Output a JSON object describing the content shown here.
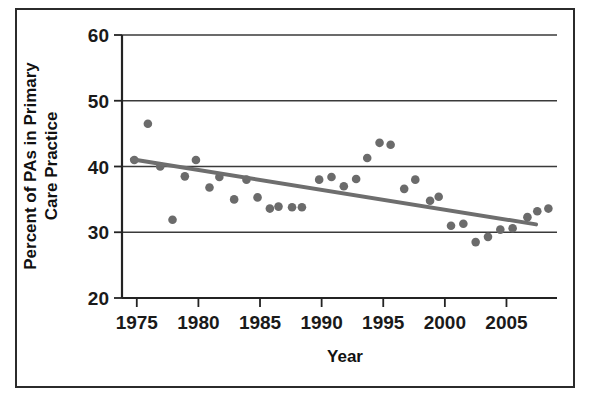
{
  "chart_data": {
    "type": "scatter",
    "title": "",
    "xlabel": "Year",
    "ylabel": "Percent of PAs in Primary Care Practice",
    "xlim": [
      1973.8,
      2009.1
    ],
    "ylim": [
      20,
      60
    ],
    "xticks": [
      1975,
      1980,
      1985,
      1990,
      1995,
      2000,
      2005
    ],
    "xtick_labels": [
      "1975",
      "1980",
      "1985",
      "1990",
      "1995",
      "2000",
      "2005"
    ],
    "yticks": [
      20,
      30,
      40,
      50,
      60
    ],
    "ytick_labels": [
      "20",
      "30",
      "40",
      "50",
      "60"
    ],
    "grid": "horizontal",
    "legend": "none",
    "series": [
      {
        "name": "Percent of PAs in Primary Care Practice",
        "marker": "circle",
        "color": "#6b6b6b",
        "points": [
          {
            "x": 1974.8,
            "y": 41.0
          },
          {
            "x": 1975.9,
            "y": 46.5
          },
          {
            "x": 1976.9,
            "y": 40.0
          },
          {
            "x": 1977.9,
            "y": 31.9
          },
          {
            "x": 1978.9,
            "y": 38.5
          },
          {
            "x": 1979.8,
            "y": 41.0
          },
          {
            "x": 1980.9,
            "y": 36.8
          },
          {
            "x": 1981.7,
            "y": 38.4
          },
          {
            "x": 1982.9,
            "y": 35.0
          },
          {
            "x": 1983.9,
            "y": 38.0
          },
          {
            "x": 1984.8,
            "y": 35.3
          },
          {
            "x": 1985.8,
            "y": 33.6
          },
          {
            "x": 1986.5,
            "y": 33.9
          },
          {
            "x": 1987.6,
            "y": 33.8
          },
          {
            "x": 1988.4,
            "y": 33.8
          },
          {
            "x": 1989.8,
            "y": 38.0
          },
          {
            "x": 1990.8,
            "y": 38.4
          },
          {
            "x": 1991.8,
            "y": 37.0
          },
          {
            "x": 1992.8,
            "y": 38.1
          },
          {
            "x": 1993.7,
            "y": 41.3
          },
          {
            "x": 1994.7,
            "y": 43.6
          },
          {
            "x": 1995.6,
            "y": 43.3
          },
          {
            "x": 1996.7,
            "y": 36.6
          },
          {
            "x": 1997.6,
            "y": 38.0
          },
          {
            "x": 1998.8,
            "y": 34.8
          },
          {
            "x": 1999.5,
            "y": 35.4
          },
          {
            "x": 2000.5,
            "y": 31.0
          },
          {
            "x": 2001.5,
            "y": 31.3
          },
          {
            "x": 2002.5,
            "y": 28.5
          },
          {
            "x": 2003.5,
            "y": 29.3
          },
          {
            "x": 2004.5,
            "y": 30.4
          },
          {
            "x": 2005.5,
            "y": 30.6
          },
          {
            "x": 2006.7,
            "y": 32.3
          },
          {
            "x": 2007.5,
            "y": 33.2
          },
          {
            "x": 2008.4,
            "y": 33.6
          }
        ]
      }
    ],
    "trendline": {
      "name": "linear-fit",
      "color": "#6e6e6e",
      "x_start": 1974.6,
      "y_start": 41.1,
      "x_end": 2007.4,
      "y_end": 31.2
    }
  },
  "axes": {
    "x_title": "Year",
    "y_title_line1": "Percent of PAs in Primary",
    "y_title_line2": "Care Practice"
  }
}
